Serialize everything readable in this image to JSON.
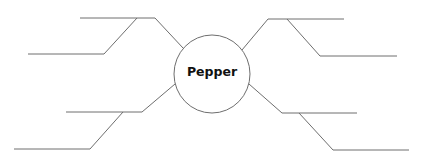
{
  "diagram": {
    "type": "spider-map",
    "center": {
      "label": "Pepper"
    },
    "branches": [
      {
        "position": "top-left",
        "lines": 2,
        "text": ""
      },
      {
        "position": "bottom-left",
        "lines": 2,
        "text": ""
      },
      {
        "position": "top-right",
        "lines": 2,
        "text": ""
      },
      {
        "position": "bottom-right",
        "lines": 2,
        "text": ""
      }
    ],
    "colors": {
      "line": "#6e6e6e",
      "text": "#111111",
      "background": "#ffffff"
    }
  }
}
